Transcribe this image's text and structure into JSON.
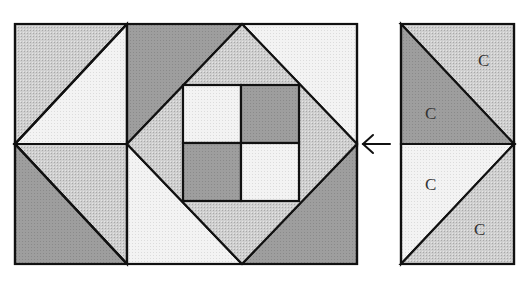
{
  "diagram": {
    "type": "quilt block piecing diagram",
    "colors": {
      "background": "#ffffff",
      "outline": "#111111",
      "dark": "#9a9a9a",
      "medium": "#c8c8c8",
      "light": "#f1f1f1",
      "label": "#333333"
    },
    "main_block": {
      "description": "Quilt block: two half-square-triangle units on the left, center diamond-in-square with four-patch center, right column partially shown",
      "center_four_patch": [
        "light",
        "dark",
        "dark",
        "light"
      ]
    },
    "arrow": {
      "glyph": "←",
      "direction": "left",
      "meaning": "unit attaches to right edge of block"
    },
    "side_unit": {
      "description": "Two half-square-triangle units stacked vertically",
      "labels": [
        "C",
        "C",
        "C",
        "C"
      ]
    }
  }
}
